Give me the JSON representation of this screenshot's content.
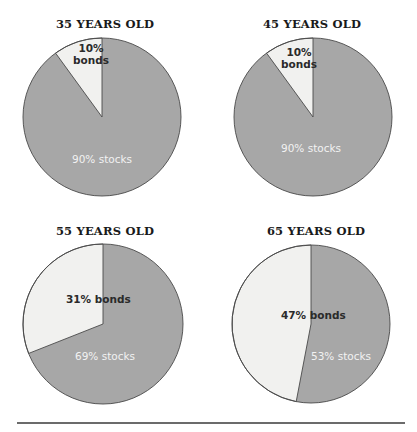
{
  "colors": {
    "stocks": "#a7a7a7",
    "bonds": "#f1f1ef",
    "outline": "#4a4a4a",
    "rule": "#3a3a3a"
  },
  "chart_data": [
    {
      "type": "pie",
      "title": "35 YEARS OLD",
      "categories": [
        "bonds",
        "stocks"
      ],
      "values": [
        10,
        90
      ],
      "labels": [
        "10%\nbonds",
        "90% stocks"
      ]
    },
    {
      "type": "pie",
      "title": "45 YEARS OLD",
      "categories": [
        "bonds",
        "stocks"
      ],
      "values": [
        10,
        90
      ],
      "labels": [
        "10%\nbonds",
        "90% stocks"
      ]
    },
    {
      "type": "pie",
      "title": "55 YEARS OLD",
      "categories": [
        "bonds",
        "stocks"
      ],
      "values": [
        31,
        69
      ],
      "labels": [
        "31% bonds",
        "69% stocks"
      ]
    },
    {
      "type": "pie",
      "title": "65 YEARS OLD",
      "categories": [
        "bonds",
        "stocks"
      ],
      "values": [
        47,
        53
      ],
      "labels": [
        "47% bonds",
        "53% stocks"
      ]
    }
  ]
}
